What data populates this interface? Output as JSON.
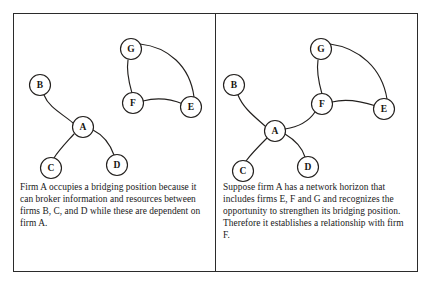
{
  "figure": {
    "type": "network-diagram-pair",
    "background_color": "#ffffff",
    "frame_color": "#2b2b2b",
    "node_fill": "#ffffff",
    "edge_color": "#23201e",
    "width": 432,
    "height": 287
  },
  "panels": [
    {
      "id": "left",
      "caption": "Firm A occupies a bridging position because it can broker information and resources between firms B, C, and D while these are dependent on firm A.",
      "nodes": [
        {
          "id": "B",
          "label": "B",
          "cx": 27,
          "cy": 72,
          "r": 10.5
        },
        {
          "id": "A",
          "label": "A",
          "cx": 70,
          "cy": 114,
          "r": 10.5
        },
        {
          "id": "C",
          "label": "C",
          "cx": 38,
          "cy": 155,
          "r": 10.5
        },
        {
          "id": "D",
          "label": "D",
          "cx": 104,
          "cy": 152,
          "r": 10.5
        },
        {
          "id": "G",
          "label": "G",
          "cx": 118,
          "cy": 36,
          "r": 10.5
        },
        {
          "id": "F",
          "label": "F",
          "cx": 120,
          "cy": 90,
          "r": 10.5
        },
        {
          "id": "E",
          "label": "E",
          "cx": 178,
          "cy": 94,
          "r": 10.5
        }
      ],
      "edges": [
        {
          "from": "B",
          "to": "A",
          "path": "M 31 82 C 36 95 50 101 60 110"
        },
        {
          "from": "A",
          "to": "C",
          "path": "M 61 121 C 52 131 46 137 41 145"
        },
        {
          "from": "A",
          "to": "D",
          "path": "M 80 117 C 90 122 97 131 101 142"
        },
        {
          "from": "G",
          "to": "F",
          "path": "M 115 47 C 113 60 117 73 119 80"
        },
        {
          "from": "F",
          "to": "E",
          "path": "M 130 88 C 145 84 158 86 170 91"
        },
        {
          "from": "G",
          "to": "E",
          "path": "M 127 31 C 155 34 177 53 181 84"
        }
      ]
    },
    {
      "id": "right",
      "caption": "Suppose firm A has a network horizon that includes firms E, F and G and recognizes the opportunity to strengthen its bridging position. Therefore it establishes a relationship with firm F.",
      "nodes": [
        {
          "id": "B",
          "label": "B",
          "cx": 18,
          "cy": 72,
          "r": 10.5
        },
        {
          "id": "A",
          "label": "A",
          "cx": 59,
          "cy": 118,
          "r": 10.5
        },
        {
          "id": "C",
          "label": "C",
          "cx": 27,
          "cy": 158,
          "r": 10.5
        },
        {
          "id": "D",
          "label": "D",
          "cx": 92,
          "cy": 154,
          "r": 10.5
        },
        {
          "id": "G",
          "label": "G",
          "cx": 105,
          "cy": 36,
          "r": 10.5
        },
        {
          "id": "F",
          "label": "F",
          "cx": 106,
          "cy": 91,
          "r": 10.5
        },
        {
          "id": "E",
          "label": "E",
          "cx": 168,
          "cy": 96,
          "r": 10.5
        }
      ],
      "edges": [
        {
          "from": "B",
          "to": "A",
          "path": "M 22 82 C 27 95 39 104 49 113"
        },
        {
          "from": "A",
          "to": "C",
          "path": "M 51 125 C 42 134 35 141 30 148"
        },
        {
          "from": "A",
          "to": "D",
          "path": "M 69 121 C 79 127 86 134 89 144"
        },
        {
          "from": "A",
          "to": "F",
          "path": "M 69 116 C 82 114 93 108 99 99"
        },
        {
          "from": "G",
          "to": "F",
          "path": "M 102 47 C 100 60 104 74 106 81"
        },
        {
          "from": "F",
          "to": "E",
          "path": "M 116 89 C 131 85 145 88 160 93"
        },
        {
          "from": "G",
          "to": "E",
          "path": "M 114 31 C 143 35 166 55 171 86"
        }
      ]
    }
  ]
}
